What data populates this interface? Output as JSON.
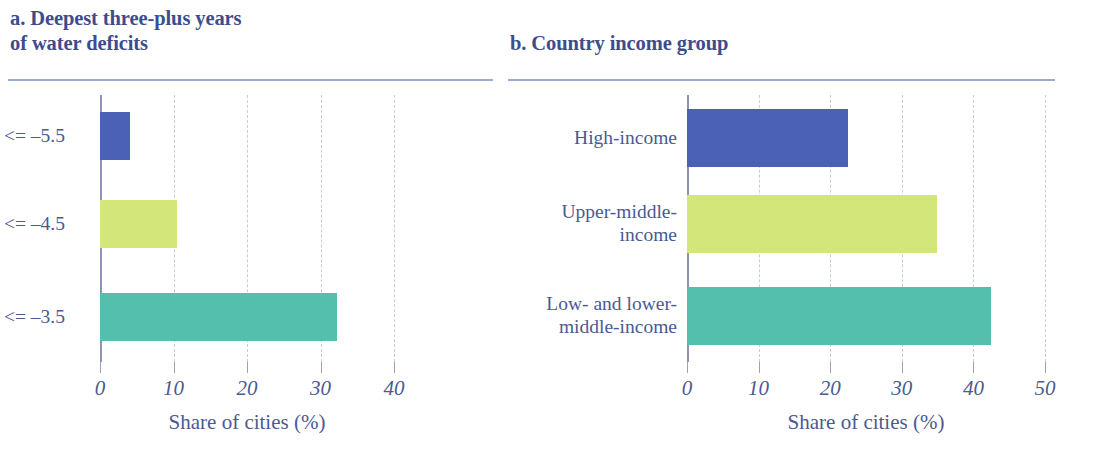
{
  "chart_data": [
    {
      "id": "panel-a",
      "type": "bar",
      "orientation": "horizontal",
      "title": "a. Deepest three-plus years\n    of water deficits",
      "xlabel": "Share of cities (%)",
      "ylabel": "",
      "categories": [
        "<= –5.5",
        "<= –4.5",
        "<= –3.5"
      ],
      "values": [
        4.1,
        10.5,
        32.3
      ],
      "colors": [
        "#4a61b5",
        "#d3e67a",
        "#55bfae"
      ],
      "xlim": [
        0,
        40
      ],
      "xticks": [
        0,
        10,
        20,
        30,
        40
      ],
      "xticklabels": [
        "0",
        "10",
        "20",
        "30",
        "40"
      ],
      "grid": "vertical-dashed",
      "legend": "none"
    },
    {
      "id": "panel-b",
      "type": "bar",
      "orientation": "horizontal",
      "title": "b. Country income group",
      "xlabel": "Share of cities (%)",
      "ylabel": "",
      "categories": [
        "High-income",
        "Upper-middle-\nincome",
        "Low- and lower-\nmiddle-income"
      ],
      "values": [
        22.5,
        34.9,
        42.5
      ],
      "colors": [
        "#4a61b5",
        "#d3e67a",
        "#55bfae"
      ],
      "xlim": [
        0,
        50
      ],
      "xticks": [
        0,
        10,
        20,
        30,
        40,
        50
      ],
      "xticklabels": [
        "0",
        "10",
        "20",
        "30",
        "40",
        "50"
      ],
      "grid": "vertical-dashed",
      "legend": "none"
    }
  ],
  "theme": {
    "text_color": "#4a5a92",
    "title_color": "#3c4d8f",
    "rule_color": "#9aaad2",
    "axis_color": "#8e93b5",
    "gridline_color": "#c9ccd4",
    "background": "#ffffff"
  }
}
